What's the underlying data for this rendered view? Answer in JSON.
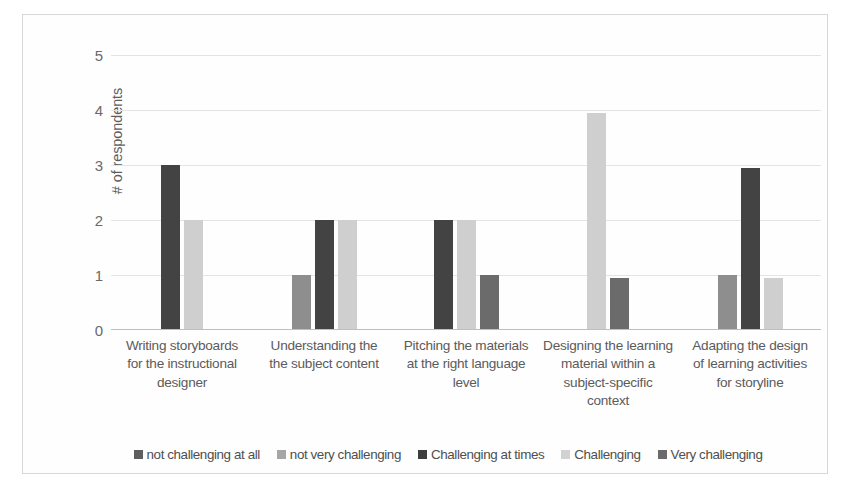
{
  "chart_data": {
    "type": "bar",
    "title": "",
    "subtitle": "",
    "xlabel": "",
    "ylabel": "# of respondents",
    "ylim": [
      0,
      5
    ],
    "yticks": [
      "0",
      "1",
      "2",
      "3",
      "4",
      "5"
    ],
    "grid": true,
    "legend_position": "bottom",
    "categories": [
      "Writing storyboards for the instructional designer",
      "Understanding the the subject content",
      "Pitching the materials at the right language level",
      "Designing the learning material within a subject-specific context",
      "Adapting the design of learning activities for storyline"
    ],
    "category_lines": [
      [
        "Writing storyboards",
        "for the instructional",
        "designer"
      ],
      [
        "Understanding the",
        "the subject content"
      ],
      [
        "Pitching the materials",
        "at the right language",
        "level"
      ],
      [
        "Designing the learning",
        "material within a",
        "subject-specific",
        "context"
      ],
      [
        "Adapting the design",
        "of learning activities",
        "for storyline"
      ]
    ],
    "series": [
      {
        "name": "not challenging at all",
        "color": "#5e5e5e",
        "values": [
          0,
          0,
          0,
          0,
          0
        ]
      },
      {
        "name": "not very challenging",
        "color": "#8e8e8e",
        "values": [
          0,
          1,
          0,
          0,
          1
        ]
      },
      {
        "name": "Challenging at times",
        "color": "#434343",
        "values": [
          3,
          2,
          2,
          0,
          2.95
        ]
      },
      {
        "name": "Challenging",
        "color": "#cfcfcf",
        "values": [
          2,
          2,
          2,
          3.95,
          0.95
        ]
      },
      {
        "name": "Very challenging",
        "color": "#6b6b6b",
        "values": [
          0,
          0,
          1,
          0.95,
          0
        ]
      }
    ]
  },
  "legend": {
    "items": [
      {
        "label": "not challenging at all",
        "color": "#5e5e5e"
      },
      {
        "label": "not very challenging",
        "color": "#a6a6a6"
      },
      {
        "label": "Challenging at times",
        "color": "#3d3d3d"
      },
      {
        "label": "Challenging",
        "color": "#d2d2d2"
      },
      {
        "label": "Very challenging",
        "color": "#6b6b6b"
      }
    ]
  }
}
